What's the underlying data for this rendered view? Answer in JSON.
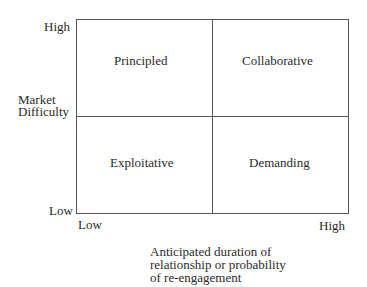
{
  "diagram": {
    "type": "2x2 matrix",
    "y_axis": {
      "label_line1": "Market",
      "label_line2": "Difficulty",
      "high": "High",
      "low": "Low"
    },
    "x_axis": {
      "low": "Low",
      "high": "High",
      "label_lines": [
        "Anticipated duration of",
        "relationship or probability",
        "of re-engagement"
      ]
    },
    "quadrants": {
      "top_left": "Principled",
      "top_right": "Collaborative",
      "bottom_left": "Exploitative",
      "bottom_right": "Demanding"
    },
    "colors": {
      "line": "#555555",
      "text": "#2a2a2a",
      "background": "#ffffff"
    }
  }
}
